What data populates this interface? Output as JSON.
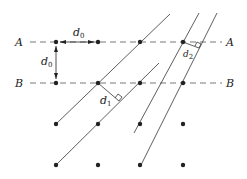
{
  "diagram": {
    "type": "lattice-planes",
    "rows": [
      {
        "label": "A",
        "y": 42
      },
      {
        "label": "B",
        "y": 83
      }
    ],
    "grid_points": {
      "columns_x": [
        56,
        98,
        140,
        183
      ],
      "rows_y": [
        42,
        83,
        124,
        165
      ]
    },
    "spacing_labels": {
      "horizontal": {
        "text": "d",
        "sub": "0"
      },
      "vertical": {
        "text": "d",
        "sub": "0"
      },
      "plane_set_1": {
        "text": "d",
        "sub": "1"
      },
      "plane_set_2": {
        "text": "d",
        "sub": "2"
      }
    },
    "colors": {
      "ink": "#222222",
      "dash": "#555555",
      "background": "#ffffff"
    }
  }
}
